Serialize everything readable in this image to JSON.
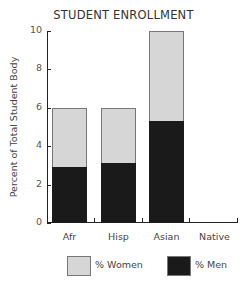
{
  "chart_data": {
    "type": "bar",
    "stacked": true,
    "title": "STUDENT ENROLLMENT",
    "xlabel": "",
    "ylabel": "Percent of Total Student Body",
    "ylim": [
      0,
      10
    ],
    "yticks": [
      0,
      2,
      4,
      6,
      8,
      10
    ],
    "categories": [
      "Afr",
      "Hisp",
      "Asian",
      "Native"
    ],
    "series": [
      {
        "name": "% Men",
        "color": "#1a1a1a",
        "values": [
          2.9,
          3.1,
          5.3,
          0
        ]
      },
      {
        "name": "% Women",
        "color": "#d6d6d6",
        "values": [
          3.1,
          2.9,
          4.7,
          0
        ]
      }
    ],
    "totals": [
      6,
      6,
      10,
      0
    ],
    "legend": [
      "% Women",
      "% Men"
    ],
    "legend_position": "bottom",
    "grid": false
  },
  "labels": {
    "title": "STUDENT ENROLLMENT",
    "ylabel": "Percent of Total Student Body",
    "yticks": [
      "0",
      "2",
      "4",
      "6",
      "8",
      "10"
    ],
    "categories": [
      "Afr",
      "Hisp",
      "Asian",
      "Native"
    ],
    "legend_women": "% Women",
    "legend_men": "% Men"
  }
}
